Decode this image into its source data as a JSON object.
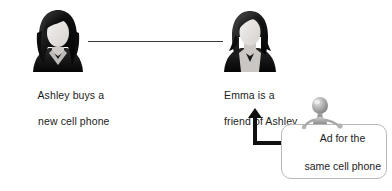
{
  "diagram": {
    "background_color": "#ffffff",
    "line_color": "#3a3a3a",
    "arrow_color": "#111111",
    "text_color": "#1c1c1c",
    "box_border_color": "#b9b9b9",
    "figure_color": "#9a9a9a"
  },
  "nodes": {
    "ashley": {
      "avatar_name": "woman-long-hair-avatar",
      "caption_line1": "Ashley buys a",
      "caption_line2": "new cell phone"
    },
    "emma": {
      "avatar_name": "woman-bob-hair-avatar",
      "caption_line1": "Emma is a",
      "caption_line2": "friend of Ashley"
    },
    "ad": {
      "text_line1": "Ad for the",
      "text_line2": "same cell phone",
      "figure_name": "grey-mannequin-figure"
    }
  },
  "connectors": {
    "friendship_link": "ashley-emma-friendship-line",
    "ad_arrow": "ad-to-emma-arrow"
  }
}
